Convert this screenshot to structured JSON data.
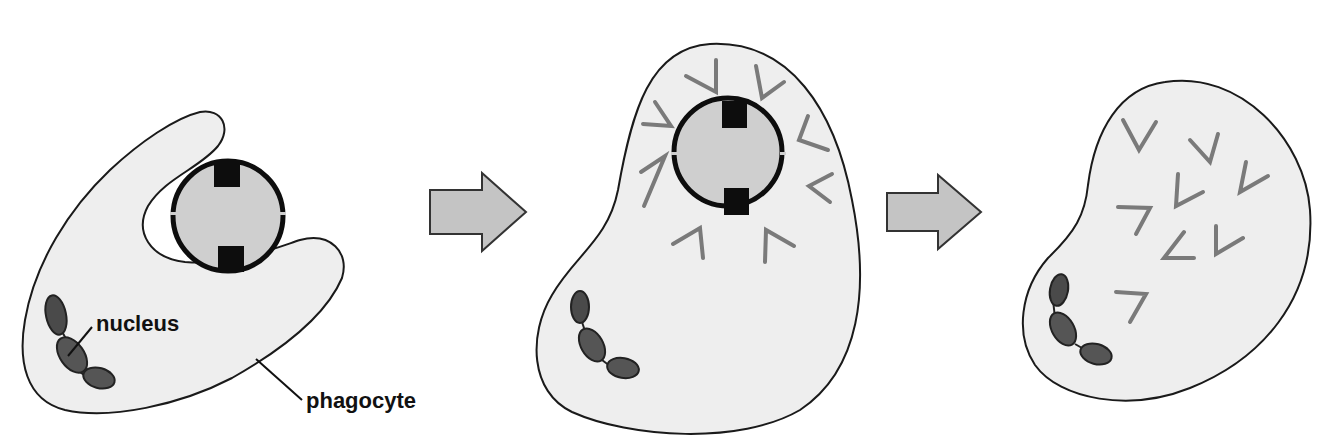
{
  "diagram": {
    "stages": [
      {
        "id": "engulfing",
        "description": "phagocyte engulfing bacterium"
      },
      {
        "id": "digesting",
        "description": "bacterium inside phagocyte surrounded by enzymes"
      },
      {
        "id": "digested",
        "description": "bacterium broken down into fragments"
      }
    ],
    "labels": {
      "nucleus": "nucleus",
      "phagocyte": "phagocyte"
    },
    "arrows": [
      {
        "from": "engulfing",
        "to": "digesting"
      },
      {
        "from": "digesting",
        "to": "digested"
      }
    ]
  },
  "colors": {
    "background": "#ffffff",
    "cell_fill": "#eeeeee",
    "cell_outline": "#1a1a1a",
    "bacterium_fill": "#cfcfcf",
    "bacterium_outline": "#0d0d0d",
    "nucleus_fill": "#4a4a4a",
    "enzyme_stroke": "#7a7a7a",
    "arrow_fill": "#c4c4c4",
    "arrow_outline": "#333333"
  }
}
